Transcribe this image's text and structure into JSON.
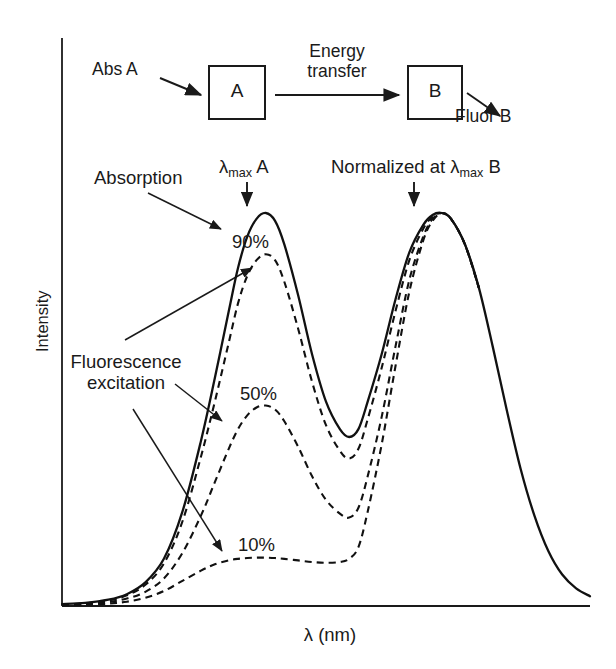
{
  "figure": {
    "scheme": {
      "abs_label": "Abs A",
      "box_a_label": "A",
      "box_b_label": "B",
      "energy_transfer_line1": "Energy",
      "energy_transfer_line2": "transfer",
      "fluor_label": "Fluor B"
    },
    "annotations": {
      "absorption": "Absorption",
      "lambda_max_a_prefix": "λ",
      "lambda_max_a_sub": "max",
      "lambda_max_a_suffix": " A",
      "normalized_prefix": "Normalized at λ",
      "normalized_sub": "max",
      "normalized_suffix": " B",
      "fluorescence_line1": "Fluorescence",
      "fluorescence_line2": "excitation",
      "pct_90": "90%",
      "pct_50": "50%",
      "pct_10": "10%"
    }
  },
  "chart_data": {
    "type": "line",
    "title": "",
    "xlabel": "λ (nm)",
    "ylabel": "Intensity",
    "xlim": [
      0,
      100
    ],
    "ylim": [
      0,
      100
    ],
    "grid": false,
    "legend": "none",
    "axis_ticks": {
      "x": [],
      "y": []
    },
    "series": [
      {
        "name": "Absorption",
        "style": "solid",
        "color": "#111111",
        "points": [
          [
            0,
            0.5
          ],
          [
            5,
            0.8
          ],
          [
            10,
            1.6
          ],
          [
            14,
            3.0
          ],
          [
            18,
            6.0
          ],
          [
            22,
            12.0
          ],
          [
            26,
            24.0
          ],
          [
            30,
            42.0
          ],
          [
            33,
            58.0
          ],
          [
            36,
            75.0
          ],
          [
            38,
            86.0
          ],
          [
            40,
            94.0
          ],
          [
            42,
            98.5
          ],
          [
            44,
            100.0
          ],
          [
            46,
            98.0
          ],
          [
            48,
            92.0
          ],
          [
            51,
            79.0
          ],
          [
            54,
            64.0
          ],
          [
            57,
            52.0
          ],
          [
            60,
            45.0
          ],
          [
            62,
            43.0
          ],
          [
            64,
            45.0
          ],
          [
            66,
            52.0
          ],
          [
            69,
            64.0
          ],
          [
            72,
            78.0
          ],
          [
            75,
            90.0
          ],
          [
            78,
            97.0
          ],
          [
            80,
            99.5
          ],
          [
            82,
            100.0
          ],
          [
            84,
            98.5
          ],
          [
            87,
            92.0
          ],
          [
            90,
            81.0
          ],
          [
            93,
            66.0
          ],
          [
            96,
            50.0
          ],
          [
            99,
            35.0
          ],
          [
            102,
            23.0
          ],
          [
            105,
            14.0
          ],
          [
            108,
            8.0
          ],
          [
            111,
            4.5
          ],
          [
            114,
            2.5
          ]
        ]
      },
      {
        "name": "90%",
        "style": "dashed",
        "color": "#111111",
        "points": [
          [
            0,
            0.4
          ],
          [
            5,
            0.7
          ],
          [
            10,
            1.4
          ],
          [
            14,
            2.7
          ],
          [
            18,
            5.4
          ],
          [
            22,
            10.8
          ],
          [
            26,
            21.5
          ],
          [
            30,
            38.0
          ],
          [
            33,
            52.0
          ],
          [
            36,
            67.0
          ],
          [
            38,
            77.0
          ],
          [
            40,
            84.0
          ],
          [
            42,
            88.0
          ],
          [
            44,
            89.5
          ],
          [
            46,
            88.0
          ],
          [
            48,
            82.5
          ],
          [
            51,
            70.5
          ],
          [
            54,
            57.0
          ],
          [
            57,
            46.0
          ],
          [
            60,
            39.5
          ],
          [
            62,
            37.5
          ],
          [
            64,
            40.0
          ],
          [
            66,
            47.5
          ],
          [
            69,
            60.5
          ],
          [
            72,
            75.0
          ],
          [
            75,
            88.0
          ],
          [
            78,
            96.0
          ],
          [
            80,
            99.0
          ],
          [
            82,
            100.0
          ],
          [
            84,
            98.5
          ],
          [
            87,
            92.0
          ],
          [
            90,
            81.0
          ]
        ]
      },
      {
        "name": "50%",
        "style": "dashed",
        "color": "#111111",
        "points": [
          [
            0,
            0.3
          ],
          [
            5,
            0.5
          ],
          [
            10,
            1.0
          ],
          [
            14,
            1.9
          ],
          [
            18,
            3.6
          ],
          [
            22,
            7.0
          ],
          [
            26,
            13.5
          ],
          [
            30,
            23.0
          ],
          [
            33,
            31.5
          ],
          [
            36,
            40.0
          ],
          [
            38,
            45.0
          ],
          [
            40,
            48.5
          ],
          [
            42,
            50.5
          ],
          [
            44,
            51.0
          ],
          [
            46,
            50.0
          ],
          [
            48,
            47.0
          ],
          [
            51,
            40.5
          ],
          [
            54,
            33.0
          ],
          [
            57,
            27.0
          ],
          [
            60,
            23.5
          ],
          [
            62,
            22.5
          ],
          [
            64,
            25.0
          ],
          [
            66,
            33.0
          ],
          [
            69,
            48.0
          ],
          [
            72,
            66.0
          ],
          [
            75,
            83.0
          ],
          [
            78,
            94.0
          ],
          [
            80,
            98.5
          ],
          [
            82,
            100.0
          ],
          [
            84,
            98.5
          ],
          [
            87,
            92.0
          ],
          [
            90,
            81.0
          ]
        ]
      },
      {
        "name": "10%",
        "style": "dashed",
        "color": "#111111",
        "points": [
          [
            0,
            0.2
          ],
          [
            5,
            0.3
          ],
          [
            10,
            0.6
          ],
          [
            14,
            1.1
          ],
          [
            18,
            2.1
          ],
          [
            22,
            3.8
          ],
          [
            26,
            6.4
          ],
          [
            30,
            9.0
          ],
          [
            33,
            10.6
          ],
          [
            36,
            11.6
          ],
          [
            38,
            12.0
          ],
          [
            40,
            12.2
          ],
          [
            42,
            12.3
          ],
          [
            44,
            12.3
          ],
          [
            46,
            12.2
          ],
          [
            48,
            12.0
          ],
          [
            51,
            11.6
          ],
          [
            54,
            11.2
          ],
          [
            57,
            11.0
          ],
          [
            60,
            11.2
          ],
          [
            62,
            12.0
          ],
          [
            64,
            15.0
          ],
          [
            66,
            24.0
          ],
          [
            69,
            41.0
          ],
          [
            72,
            61.0
          ],
          [
            75,
            80.0
          ],
          [
            78,
            93.0
          ],
          [
            80,
            98.0
          ],
          [
            82,
            100.0
          ],
          [
            84,
            98.5
          ],
          [
            87,
            92.0
          ],
          [
            90,
            81.0
          ]
        ]
      }
    ]
  }
}
